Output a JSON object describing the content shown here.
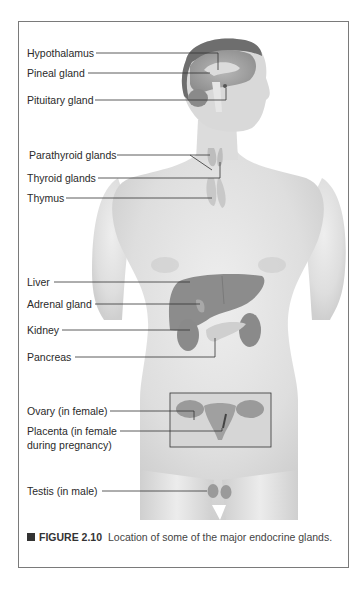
{
  "figure": {
    "caption_number": "FIGURE 2.10",
    "caption_text": "Location of some of the major endocrine glands.",
    "colors": {
      "skin": "#e4e4e4",
      "organ": "#8a8a8a",
      "leader_line": "#333333",
      "frame": "#7a7a7a"
    }
  },
  "labels": {
    "hypothalamus": "Hypothalamus",
    "pineal": "Pineal gland",
    "pituitary": "Pituitary gland",
    "parathyroid": "Parathyroid glands",
    "thyroid": "Thyroid glands",
    "thymus": "Thymus",
    "liver": "Liver",
    "adrenal": "Adrenal gland",
    "kidney": "Kidney",
    "pancreas": "Pancreas",
    "ovary": "Ovary (in female)",
    "placenta_line1": "Placenta (in female",
    "placenta_line2": "during pregnancy)",
    "testis": "Testis (in male)"
  }
}
